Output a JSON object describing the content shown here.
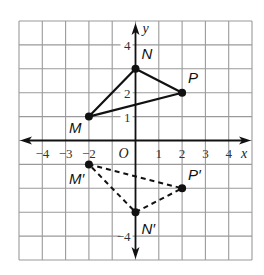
{
  "figure": {
    "type": "coordinate-plane-reflection",
    "axis_labels": {
      "x": "x",
      "y": "y",
      "origin": "O"
    },
    "x_ticks": [
      {
        "value": -4,
        "label": "−4"
      },
      {
        "value": -3,
        "label": "−3"
      },
      {
        "value": -2,
        "label": "−2"
      },
      {
        "value": 1,
        "label": "1"
      },
      {
        "value": 2,
        "label": "2"
      },
      {
        "value": 3,
        "label": "3"
      },
      {
        "value": 4,
        "label": "4"
      }
    ],
    "y_ticks": [
      {
        "value": 4,
        "label": "4"
      },
      {
        "value": 2,
        "label": "2"
      },
      {
        "value": 1,
        "label": "1"
      },
      {
        "value": -4,
        "label": "−4"
      }
    ],
    "grid": {
      "x_min": -5,
      "x_max": 5,
      "y_min": -5,
      "y_max": 5
    },
    "original_triangle": {
      "style": "solid",
      "vertices": [
        {
          "name": "N",
          "x": 0,
          "y": 3
        },
        {
          "name": "P",
          "x": 2,
          "y": 2
        },
        {
          "name": "M",
          "x": -2,
          "y": 1
        }
      ]
    },
    "image_triangle": {
      "style": "dashed",
      "vertices": [
        {
          "name": "N′",
          "x": 0,
          "y": -3
        },
        {
          "name": "P′",
          "x": 2,
          "y": -2
        },
        {
          "name": "M′",
          "x": -2,
          "y": -1
        }
      ]
    },
    "colors": {
      "grid": "#9a9a9a",
      "axes": "#111111",
      "shape": "#111111"
    }
  }
}
